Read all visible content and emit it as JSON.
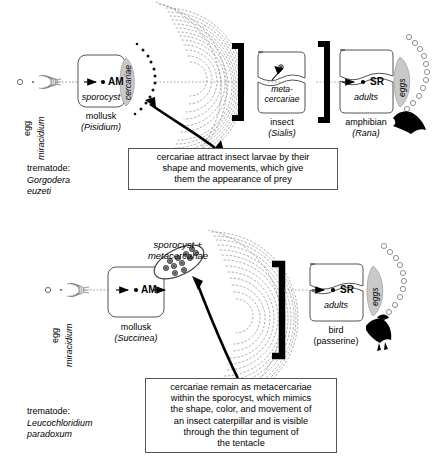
{
  "figure": {
    "colors": {
      "ink": "#000000",
      "fill_gray": "#c9c9c9",
      "line_gray": "#555555",
      "white": "#ffffff"
    }
  },
  "panels": [
    {
      "id": "top",
      "trematode": {
        "prefix": "trematode:",
        "genus": "Gorgodera",
        "species": "euzeti"
      },
      "stages": {
        "egg": "egg",
        "miracidium": "miracidium",
        "cercariae": "cercariae",
        "eggs": "eggs"
      },
      "hosts": [
        {
          "name": "mollusk",
          "taxon": "(Pisidium)",
          "marker": "AM",
          "stage_label": "sporocyst"
        },
        {
          "name": "insect",
          "taxon": "(Sialis)",
          "marker": "",
          "stage_label_line1": "meta-",
          "stage_label_line2": "cercariae"
        },
        {
          "name": "amphibian",
          "taxon": "(Rana)",
          "marker": "SR",
          "stage_label": "adults"
        }
      ],
      "caption": {
        "lines": [
          "cercariae attract insect larvae by their",
          "shape and movements, which give",
          "them the appearance of prey"
        ]
      }
    },
    {
      "id": "bottom",
      "trematode": {
        "prefix": "trematode:",
        "genus": "Leucochloridium",
        "species": "paradoxum"
      },
      "stages": {
        "egg": "egg",
        "miracidium": "miracidium",
        "sporocyst_plus_line1": "sporocyst +",
        "sporocyst_plus_line2": "metacercariae",
        "eggs": "eggs"
      },
      "hosts": [
        {
          "name": "mollusk",
          "taxon": "(Succinea)",
          "marker": "AM",
          "stage_label": ""
        },
        {
          "name": "bird",
          "taxon": "(passerine)",
          "marker": "SR",
          "stage_label": "adults"
        }
      ],
      "caption": {
        "lines": [
          "cercariae remain as metacercariae",
          "within the sporocyst, which mimics",
          "the shape, color, and movement of",
          "an insect caterpillar and is visible",
          "through the thin tegument of",
          "the tentacle"
        ]
      }
    }
  ]
}
